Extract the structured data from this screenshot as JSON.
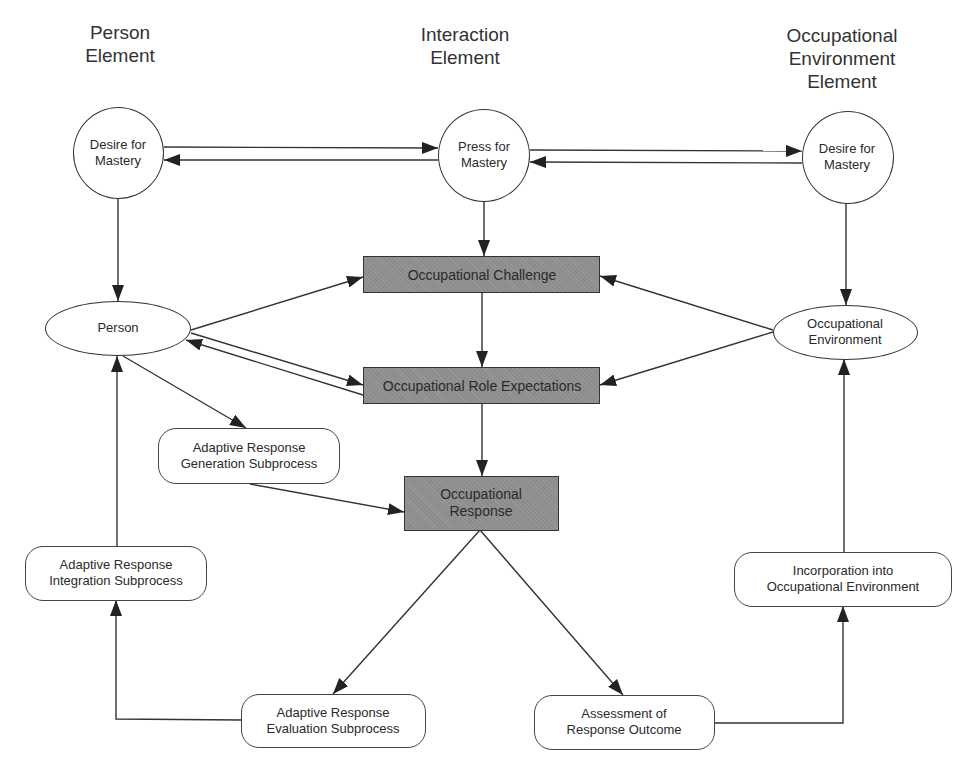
{
  "diagram": {
    "columns": {
      "person": "Person\nElement",
      "interaction": "Interaction\nElement",
      "environment": "Occupational\nEnvironment\nElement"
    },
    "nodes": {
      "person_desire": {
        "line1": "Desire for",
        "line2": "Mastery",
        "shape": "circle"
      },
      "press_mastery": {
        "line1": "Press for",
        "line2": "Mastery",
        "shape": "circle"
      },
      "env_desire": {
        "line1": "Desire for",
        "line2": "Mastery",
        "shape": "circle"
      },
      "person": {
        "line1": "Person",
        "shape": "ellipse"
      },
      "occ_environment": {
        "line1": "Occupational",
        "line2": "Environment",
        "shape": "ellipse"
      },
      "occ_challenge": {
        "line1": "Occupational Challenge",
        "shape": "shaded-rect"
      },
      "role_expectations": {
        "line1": "Occupational Role Expectations",
        "shape": "shaded-rect"
      },
      "occ_response": {
        "line1": "Occupational",
        "line2": "Response",
        "shape": "shaded-rect"
      },
      "generation": {
        "line1": "Adaptive Response",
        "line2": "Generation Subprocess",
        "shape": "rounded-rect"
      },
      "integration": {
        "line1": "Adaptive Response",
        "line2": "Integration Subprocess",
        "shape": "rounded-rect"
      },
      "evaluation": {
        "line1": "Adaptive Response",
        "line2": "Evaluation Subprocess",
        "shape": "rounded-rect"
      },
      "assessment": {
        "line1": "Assessment of",
        "line2": "Response Outcome",
        "shape": "rounded-rect"
      },
      "incorporation": {
        "line1": "Incorporation into",
        "line2": "Occupational Environment",
        "shape": "rounded-rect"
      }
    },
    "edges": [
      {
        "from": "person_desire",
        "to": "press_mastery"
      },
      {
        "from": "press_mastery",
        "to": "person_desire"
      },
      {
        "from": "press_mastery",
        "to": "env_desire"
      },
      {
        "from": "env_desire",
        "to": "press_mastery"
      },
      {
        "from": "person_desire",
        "to": "person"
      },
      {
        "from": "press_mastery",
        "to": "occ_challenge"
      },
      {
        "from": "env_desire",
        "to": "occ_environment"
      },
      {
        "from": "person",
        "to": "occ_challenge"
      },
      {
        "from": "person",
        "to": "role_expectations"
      },
      {
        "from": "role_expectations",
        "to": "person"
      },
      {
        "from": "occ_environment",
        "to": "occ_challenge"
      },
      {
        "from": "occ_environment",
        "to": "role_expectations"
      },
      {
        "from": "occ_challenge",
        "to": "role_expectations"
      },
      {
        "from": "role_expectations",
        "to": "occ_response"
      },
      {
        "from": "person",
        "to": "generation"
      },
      {
        "from": "generation",
        "to": "occ_response"
      },
      {
        "from": "occ_response",
        "to": "evaluation"
      },
      {
        "from": "occ_response",
        "to": "assessment"
      },
      {
        "from": "evaluation",
        "to": "integration"
      },
      {
        "from": "integration",
        "to": "person"
      },
      {
        "from": "assessment",
        "to": "incorporation"
      },
      {
        "from": "incorporation",
        "to": "occ_environment"
      }
    ],
    "colors": {
      "line": "#333333",
      "shaded_fill": "#8c8c8c",
      "background": "#ffffff"
    }
  }
}
